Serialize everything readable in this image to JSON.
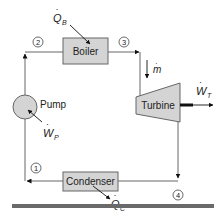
{
  "diagram": {
    "type": "rankine-cycle-schematic",
    "components": {
      "boiler": {
        "label": "Boiler"
      },
      "turbine": {
        "label": "Turbine"
      },
      "condenser": {
        "label": "Condenser"
      },
      "pump": {
        "label": "Pump"
      }
    },
    "states": [
      "1",
      "2",
      "3",
      "4"
    ],
    "flows": {
      "heat_in": {
        "symbol": "Q",
        "subscript": "B"
      },
      "heat_out": {
        "symbol": "Q",
        "subscript": "C"
      },
      "work_turbine": {
        "symbol": "W",
        "subscript": "T"
      },
      "work_pump": {
        "symbol": "W",
        "subscript": "P"
      },
      "mass_flow": {
        "symbol": "m"
      }
    },
    "colors": {
      "component_fill": "#d4d4d4",
      "line": "#555555",
      "bar": "#6a6a6a"
    }
  }
}
